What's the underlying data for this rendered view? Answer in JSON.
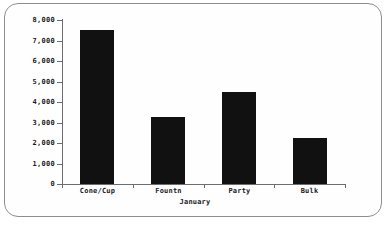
{
  "chart_data": {
    "type": "bar",
    "title": "",
    "xlabel": "January",
    "ylabel": "",
    "categories": [
      "Cone/Cup",
      "Fountn",
      "Party",
      "Bulk"
    ],
    "values": [
      7500,
      3250,
      4500,
      2250
    ],
    "ylim": [
      0,
      8000
    ],
    "ytick_labels": [
      "8,000",
      "7,000",
      "6,000",
      "5,000",
      "4,000",
      "3,000",
      "2,000",
      "1,000",
      "0"
    ],
    "ytick_values": [
      8000,
      7000,
      6000,
      5000,
      4000,
      3000,
      2000,
      1000,
      0
    ],
    "grid": false,
    "legend": null,
    "bar_color": "#111111",
    "axis_color": "#6d6d6d",
    "background_color": "#fefefe",
    "border_color": "#8e8e8e"
  }
}
